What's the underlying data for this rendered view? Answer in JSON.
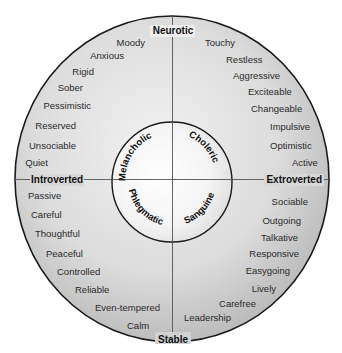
{
  "axes": {
    "top": "Neurotic",
    "bottom": "Stable",
    "left": "Introverted",
    "right": "Extroverted"
  },
  "temperaments": {
    "top_left": "Melancholic",
    "top_right": "Choleric",
    "bottom_left": "Phlegmatic",
    "bottom_right": "Sanguine"
  },
  "quadrants": {
    "neurotic_introverted": [
      "Moody",
      "Anxious",
      "Rigid",
      "Sober",
      "Pessimistic",
      "Reserved",
      "Unsociable",
      "Quiet"
    ],
    "neurotic_extroverted": [
      "Touchy",
      "Restless",
      "Aggressive",
      "Exciteable",
      "Changeable",
      "Impulsive",
      "Optimistic",
      "Active"
    ],
    "stable_introverted": [
      "Passive",
      "Careful",
      "Thoughtful",
      "Peaceful",
      "Controlled",
      "Reliable",
      "Even-tempered",
      "Calm"
    ],
    "stable_extroverted": [
      "Sociable",
      "Outgoing",
      "Talkative",
      "Responsive",
      "Easygoing",
      "Lively",
      "Carefree",
      "Leadership"
    ]
  },
  "colors": {
    "outer_fill_light": "#ececec",
    "outer_fill_dark": "#b9b9b9",
    "inner_fill_light": "#ffffff",
    "inner_fill_dark": "#d6d6d6",
    "stroke": "#1a1a1a"
  }
}
